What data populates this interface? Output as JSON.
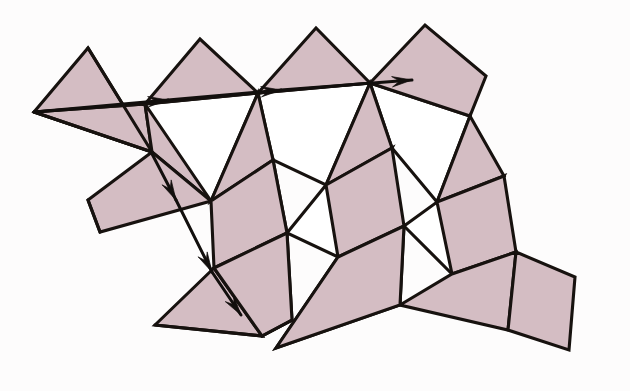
{
  "figure": {
    "kind": "geometric-diagram",
    "background_color": "#fdfcfc",
    "fill_color": "#d4bdc3",
    "empty_color": "#ffffff",
    "stroke_color": "#17120f",
    "canvas": {
      "width": 630,
      "height": 391
    }
  },
  "geometry": {
    "shaded_faces": [
      {
        "name": "face-top-left-upper",
        "points": "34,112 88,48 152,152"
      },
      {
        "name": "face-top-left-lower",
        "points": "34,112 152,152 145,104"
      },
      {
        "name": "face-top-row-2",
        "points": "145,104 200,39 258,93"
      },
      {
        "name": "face-top-row-3",
        "points": "258,93 316,28 370,83"
      },
      {
        "name": "face-top-row-4-quad",
        "points": "370,83 425,25 486,76 470,116"
      },
      {
        "name": "face-mid-left-wedge",
        "points": "152,152 211,201 145,104"
      },
      {
        "name": "face-mid-2",
        "points": "258,93 273,160 211,201"
      },
      {
        "name": "face-mid-3",
        "points": "370,83 392,148 326,185"
      },
      {
        "name": "face-mid-4",
        "points": "470,116 504,176 437,202"
      },
      {
        "name": "face-lower-left-upper",
        "points": "88,200 152,152 211,201 100,232"
      },
      {
        "name": "face-lower-band-2",
        "points": "211,201 273,160 287,233 214,268"
      },
      {
        "name": "face-lower-band-3",
        "points": "326,185 392,148 404,226 338,257"
      },
      {
        "name": "face-lower-band-4",
        "points": "437,202 504,176 516,252 452,274"
      },
      {
        "name": "face-bottom-1",
        "points": "155,325 214,268 262,336"
      },
      {
        "name": "face-bottom-2",
        "points": "214,268 287,233 292,320 262,336"
      },
      {
        "name": "face-bottom-3",
        "points": "276,348 338,257 404,226 400,305"
      },
      {
        "name": "face-bottom-4",
        "points": "400,305 452,274 516,252 508,330"
      },
      {
        "name": "face-bottom-right-tail",
        "points": "516,252 575,277 569,350 508,330"
      }
    ],
    "empty_faces": [
      {
        "name": "hole-upper-1",
        "points": "145,104 258,93 211,201 152,152"
      },
      {
        "name": "hole-upper-2",
        "points": "258,93 370,83 326,185 273,160"
      },
      {
        "name": "hole-upper-3",
        "points": "370,83 470,116 437,202 392,148"
      },
      {
        "name": "hole-lower-1",
        "points": "211,201 273,160 287,233"
      },
      {
        "name": "hole-lower-2",
        "points": "287,233 326,185 392,148 338,257"
      },
      {
        "name": "hole-lower-3",
        "points": "404,226 437,202 504,176 452,274"
      },
      {
        "name": "hole-bottom-1",
        "points": "262,336 292,320 287,233 214,268"
      },
      {
        "name": "hole-bottom-2",
        "points": "338,257 404,226 400,305 276,348"
      }
    ],
    "extra_edges": [
      {
        "name": "edge-left-diagonal",
        "points": "34,112 152,152"
      },
      {
        "name": "edge-left-apex-down",
        "points": "88,48 152,152"
      },
      {
        "name": "edge-left-lower-fold",
        "points": "34,112 145,104"
      },
      {
        "name": "edge-lower-left-fold",
        "points": "88,200 100,232"
      },
      {
        "name": "edge-bottom-fold-1",
        "points": "155,325 262,336"
      },
      {
        "name": "edge-bottom-fold-2",
        "points": "262,336 292,320"
      }
    ],
    "path_arrows": [
      {
        "name": "arrow-right-1",
        "from": "34,112",
        "to": "168,100",
        "head_at": "168,100",
        "angle": -5
      },
      {
        "name": "arrow-right-2",
        "from": "168,100",
        "to": "281,90",
        "head_at": "281,90",
        "angle": -5
      },
      {
        "name": "arrow-right-3",
        "from": "281,90",
        "to": "412,80",
        "head_at": "412,80",
        "angle": -5
      },
      {
        "name": "arrow-down-1",
        "from": "150,150",
        "to": "176,200",
        "head_at": "176,200",
        "angle": 62
      },
      {
        "name": "arrow-down-2",
        "from": "176,200",
        "to": "212,272",
        "head_at": "212,272",
        "angle": 62
      },
      {
        "name": "arrow-down-3",
        "from": "212,272",
        "to": "241,315",
        "head_at": "241,315",
        "angle": 55
      }
    ]
  }
}
